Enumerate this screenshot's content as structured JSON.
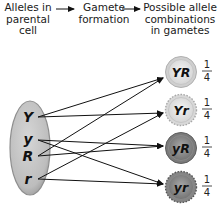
{
  "headers": {
    "parental": "Alleles in\nparental\ncell",
    "formation": "Gamete\nformation",
    "gametes": "Possible allele\ncombinations\nin gametes"
  },
  "parental_cell": {
    "alleles": [
      "Y",
      "y",
      "R",
      "r"
    ]
  },
  "gametes": [
    {
      "label": "YR",
      "numerator": "1",
      "denominator": "4"
    },
    {
      "label": "Yr",
      "numerator": "1",
      "denominator": "4"
    },
    {
      "label": "yR",
      "numerator": "1",
      "denominator": "4"
    },
    {
      "label": "yr",
      "numerator": "1",
      "denominator": "4"
    }
  ],
  "connections": [
    {
      "from": "Y",
      "to": "YR"
    },
    {
      "from": "Y",
      "to": "Yr"
    },
    {
      "from": "y",
      "to": "yR"
    },
    {
      "from": "y",
      "to": "yr"
    },
    {
      "from": "R",
      "to": "YR"
    },
    {
      "from": "R",
      "to": "yR"
    },
    {
      "from": "r",
      "to": "Yr"
    },
    {
      "from": "r",
      "to": "yr"
    }
  ],
  "colors": {
    "cell_fill": "#c4c4c4",
    "cell_edge": "#8e8e8e",
    "gamete_light": "#e6e6e6",
    "gamete_dark": "#8a8a8a",
    "line": "#111111"
  }
}
